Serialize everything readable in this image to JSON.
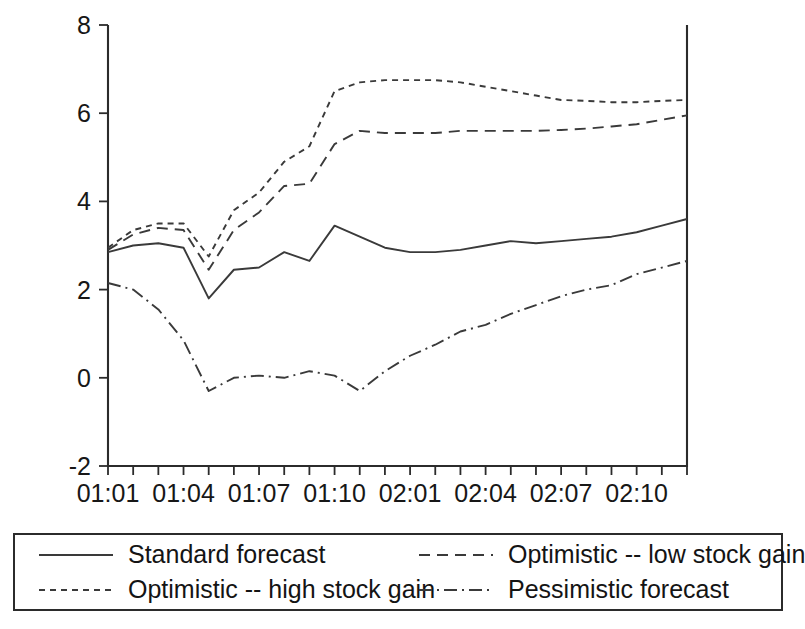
{
  "chart_data": {
    "type": "line",
    "title": "",
    "xlabel": "",
    "ylabel": "",
    "ylim": [
      -2,
      8
    ],
    "yticks": [
      -2,
      0,
      2,
      4,
      6,
      8
    ],
    "ytick_labels": [
      "-2",
      "0",
      "2",
      "4",
      "6",
      "8"
    ],
    "grid": false,
    "legend_position": "below-plot",
    "x": [
      "01:01",
      "01:02",
      "01:03",
      "01:04",
      "01:05",
      "01:06",
      "01:07",
      "01:08",
      "01:09",
      "01:10",
      "01:11",
      "01:12",
      "02:01",
      "02:02",
      "02:03",
      "02:04",
      "02:05",
      "02:06",
      "02:07",
      "02:08",
      "02:09",
      "02:10",
      "02:11",
      "02:12"
    ],
    "xtick_labels": [
      "01:01",
      "01:04",
      "01:07",
      "01:10",
      "02:01",
      "02:04",
      "02:07",
      "02:10"
    ],
    "xtick_label_every": 3,
    "series": [
      {
        "name": "Standard forecast",
        "style": "solid",
        "values": [
          2.85,
          3.0,
          3.05,
          2.95,
          1.8,
          2.45,
          2.5,
          2.85,
          2.65,
          3.45,
          3.2,
          2.95,
          2.85,
          2.85,
          2.9,
          3.0,
          3.1,
          3.05,
          3.1,
          3.15,
          3.2,
          3.3,
          3.45,
          3.6
        ]
      },
      {
        "name": "Optimistic -- low stock gain",
        "style": "dashed",
        "values": [
          2.9,
          3.25,
          3.4,
          3.35,
          2.45,
          3.35,
          3.75,
          4.35,
          4.4,
          5.3,
          5.6,
          5.55,
          5.55,
          5.55,
          5.6,
          5.6,
          5.6,
          5.6,
          5.62,
          5.65,
          5.7,
          5.75,
          5.85,
          5.95
        ]
      },
      {
        "name": "Optimistic -- high stock gain",
        "style": "dotted",
        "values": [
          2.95,
          3.35,
          3.5,
          3.5,
          2.75,
          3.8,
          4.2,
          4.9,
          5.25,
          6.5,
          6.7,
          6.75,
          6.75,
          6.75,
          6.7,
          6.6,
          6.5,
          6.4,
          6.3,
          6.28,
          6.25,
          6.25,
          6.28,
          6.3
        ]
      },
      {
        "name": "Pessimistic forecast",
        "style": "dashdot",
        "values": [
          2.15,
          2.0,
          1.55,
          0.85,
          -0.3,
          0.0,
          0.05,
          0.0,
          0.15,
          0.05,
          -0.3,
          0.15,
          0.5,
          0.75,
          1.05,
          1.2,
          1.45,
          1.65,
          1.85,
          2.0,
          2.1,
          2.35,
          2.5,
          2.65
        ]
      }
    ]
  },
  "legend": {
    "entries": [
      {
        "label": "Standard forecast",
        "style": "solid"
      },
      {
        "label": "Optimistic -- low stock gain",
        "style": "dashed"
      },
      {
        "label": "Optimistic -- high stock gain",
        "style": "dotted"
      },
      {
        "label": "Pessimistic forecast",
        "style": "dashdot"
      }
    ]
  },
  "colors": {
    "line": "#3a3a3a",
    "axis": "#2b2b2b",
    "text": "#171717",
    "background": "#ffffff"
  }
}
